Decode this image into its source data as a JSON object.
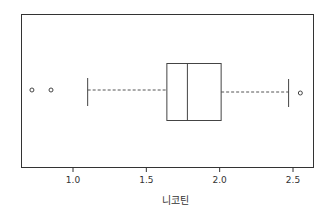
{
  "chart_data": {
    "type": "boxplot",
    "orientation": "horizontal",
    "title": "",
    "xlabel": "니코틴",
    "ylabel": "",
    "xlim": [
      0.65,
      2.63
    ],
    "xticks": [
      1.0,
      1.5,
      2.0,
      2.5
    ],
    "xtick_labels": [
      "1.0",
      "1.5",
      "2.0",
      "2.5"
    ],
    "grid": false,
    "box": {
      "whisker_low": 1.1,
      "q1": 1.64,
      "median": 1.78,
      "q3": 2.01,
      "whisker_high": 2.47
    },
    "outliers": [
      0.72,
      0.85,
      2.55
    ]
  }
}
